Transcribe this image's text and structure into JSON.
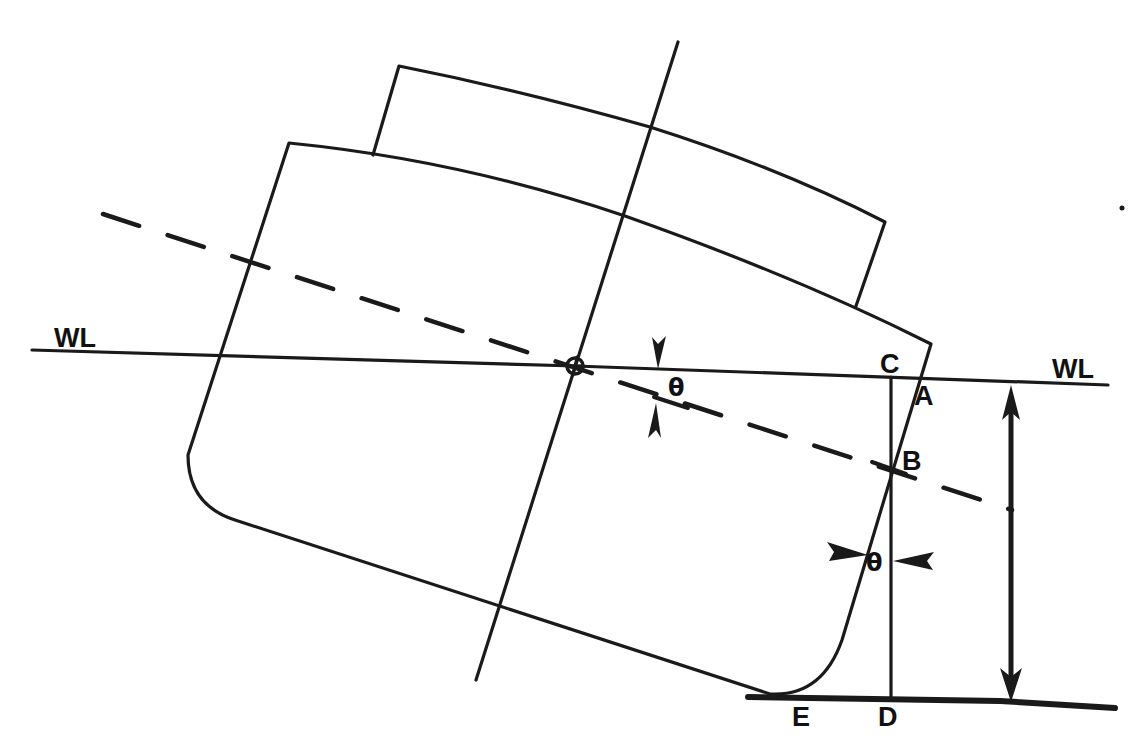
{
  "diagram": {
    "colors": {
      "ink": "#1a1a1a",
      "background": "#ffffff"
    },
    "labels": {
      "wl_left": "WL",
      "wl_right": "WL",
      "point_c": "C",
      "point_a": "A",
      "point_b": "B",
      "point_d": "D",
      "point_e": "E",
      "theta_top": "θ",
      "theta_bottom": "θ"
    },
    "elements": {
      "waterline": "Horizontal waterline WL",
      "heeled_waterline": "Dashed inclined waterline through center of rotation",
      "centerline": "Vessel centerline (inclined)",
      "hull": "Heeled hull outline with rounded bilges",
      "superstructure": "Deckhouse above main deck",
      "draft_arrow": "Double-headed vertical dimension arrow from WL to bottom line",
      "bottom_line": "Horizontal baseline through D and E",
      "pivot": "Center of rotation marker (circle with cross)"
    }
  }
}
